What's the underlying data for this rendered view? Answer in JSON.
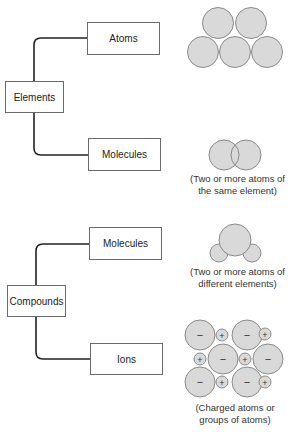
{
  "elements": {
    "root_label": "Elements",
    "atoms_label": "Atoms",
    "molecules_label": "Molecules",
    "molecules_caption_line1": "(Two or more atoms of",
    "molecules_caption_line2": "the same element)"
  },
  "compounds": {
    "root_label": "Compounds",
    "molecules_label": "Molecules",
    "ions_label": "Ions",
    "molecules_caption_line1": "(Two or more atoms of",
    "molecules_caption_line2": "different elements)",
    "ions_caption_line1": "(Charged atoms or",
    "ions_caption_line2": "groups of atoms)"
  },
  "ions_symbols": {
    "negative": "−",
    "positive": "+"
  },
  "colors": {
    "atom_fill": "#d9d9d9",
    "atom_stroke": "#8a8a8a",
    "line": "#222222"
  }
}
